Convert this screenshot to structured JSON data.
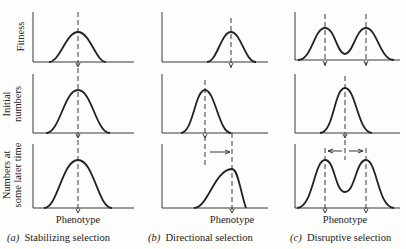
{
  "diagram": {
    "row_labels": {
      "fitness": "Fitness",
      "initial_line1": "Initial",
      "initial_line2": "numbers",
      "later_line1": "Numbers at",
      "later_line2": "some later time"
    },
    "x_axis_label": "Phenotype",
    "panels": [
      {
        "id": "a",
        "letter": "(a)",
        "caption": "Stabilizing selection"
      },
      {
        "id": "b",
        "letter": "(b)",
        "caption": "Directional selection"
      },
      {
        "id": "c",
        "letter": "(c)",
        "caption": "Disruptive selection"
      }
    ],
    "colors": {
      "line": "#1a1a1a",
      "background": "#fdfdfb"
    }
  }
}
